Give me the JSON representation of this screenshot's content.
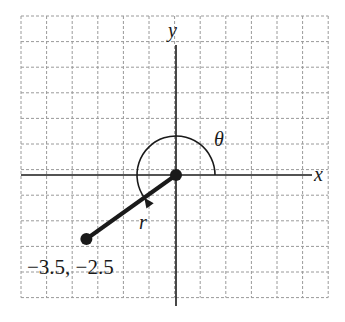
{
  "figure": {
    "type": "polar-coordinate-diagram",
    "axes": {
      "x_label": "x",
      "y_label": "y"
    },
    "grid": {
      "columns": 12,
      "rows": 11,
      "unit_per_cell": 1,
      "line_style": "dashed",
      "line_color": "#9a9a9a"
    },
    "point": {
      "label": "−3.5, −2.5",
      "x": -3.5,
      "y": -2.5
    },
    "segment_label": "r",
    "angle_label": "θ",
    "colors": {
      "ink": "#1a1a1a",
      "grid": "#9a9a9a",
      "background": "#ffffff"
    }
  }
}
